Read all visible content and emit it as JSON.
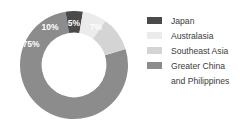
{
  "chart_data": {
    "type": "pie",
    "variant": "donut",
    "title": "",
    "xlabel": "",
    "ylabel": "",
    "categories": [
      "Japan",
      "Australasia",
      "Southeast Asia",
      "Greater China and Philippines"
    ],
    "values": [
      5,
      7,
      10,
      75
    ],
    "unit": "%",
    "data_labels": [
      "5%",
      "7%",
      "10%",
      "75%"
    ],
    "colors": [
      "#4a4a4a",
      "#ebebeb",
      "#d4d4d4",
      "#8c8c8c"
    ],
    "legend_position": "right",
    "grid": false,
    "start_angle_deg": -9,
    "inner_radius_ratio": 0.6
  },
  "legend": {
    "items": [
      {
        "label": "Japan",
        "color": "#4a4a4a"
      },
      {
        "label": "Australasia",
        "color": "#ebebeb"
      },
      {
        "label": "Southeast Asia",
        "color": "#d4d4d4"
      },
      {
        "label": "Greater China",
        "color": "#8c8c8c",
        "label_line2": "and Philippines"
      }
    ]
  },
  "slice_labels": {
    "japan": "5%",
    "australasia": "7%",
    "southeast_asia": "10%",
    "greater_china": "75%"
  }
}
